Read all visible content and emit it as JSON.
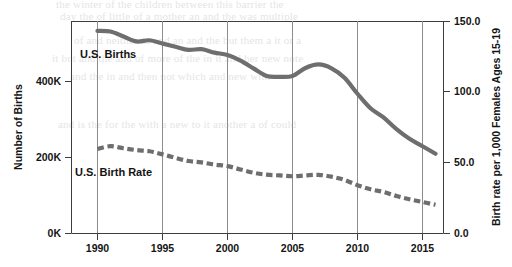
{
  "figure": {
    "background_color": "#ffffff",
    "series_label_births": "U.S. Births",
    "series_label_rate": "U.S. Birth Rate"
  },
  "axes": {
    "left_title": "Number of Births",
    "right_title": "Birth rate per 1,000 Females Ages 15-19",
    "left_ticks": [
      "0K",
      "200K",
      "400K"
    ],
    "right_ticks": [
      "0.0",
      "50.0",
      "100.0",
      "150.0"
    ],
    "x_ticks": [
      "1990",
      "1995",
      "2000",
      "2005",
      "2010",
      "2015"
    ]
  },
  "colors": {
    "line": "#6e6e6e",
    "axis": "#3d3d3d",
    "grid": "#8d8d8d",
    "text": "#141414"
  },
  "bleed_text": [
    "the winter of the children between this barrier the",
    "day the of little of a mother an and the was multiple",
    "of and neither as and an and the but them a it or a",
    "it but and the and of more of the in it and her new note",
    "and the in and then not which and new with",
    "and is the for the with a new to it another a of could"
  ],
  "chart_data": {
    "type": "line",
    "title": "",
    "xlabel": "",
    "ylabel": "Number of Births",
    "y2label": "Birth rate per 1,000 Females Ages 15-19",
    "xlim": [
      1988.0,
      2017.5
    ],
    "ylim": [
      0,
      614000
    ],
    "y2lim": [
      0.0,
      150.0
    ],
    "grid": "vertical-at-x-ticks",
    "legend": "inline-labels",
    "x": [
      1990,
      1991,
      1992,
      1993,
      1994,
      1995,
      1996,
      1997,
      1998,
      1999,
      2000,
      2001,
      2002,
      2003,
      2004,
      2005,
      2006,
      2007,
      2008,
      2009,
      2010,
      2011,
      2012,
      2013,
      2014,
      2015,
      2016
    ],
    "series": [
      {
        "name": "U.S. Births",
        "axis": "left",
        "units": "births",
        "style": "solid",
        "values": [
          533483,
          531591,
          518389,
          505415,
          508519,
          499873,
          491577,
          483220,
          484975,
          476050,
          469550,
          455000,
          434450,
          414580,
          412350,
          414590,
          435436,
          444899,
          434785,
          409840,
          367750,
          329797,
          305420,
          274641,
          249078,
          229715,
          209809
        ]
      },
      {
        "name": "U.S. Birth Rate",
        "axis": "right",
        "units": "births per 1,000 females ages 15-19",
        "style": "dashed",
        "values": [
          59.9,
          61.8,
          60.3,
          59.0,
          58.2,
          56.0,
          53.5,
          51.3,
          50.3,
          48.8,
          47.7,
          45.3,
          43.0,
          41.6,
          41.1,
          40.5,
          41.1,
          41.5,
          40.2,
          37.9,
          34.2,
          31.3,
          29.4,
          26.5,
          24.2,
          22.3,
          20.3
        ]
      }
    ]
  }
}
